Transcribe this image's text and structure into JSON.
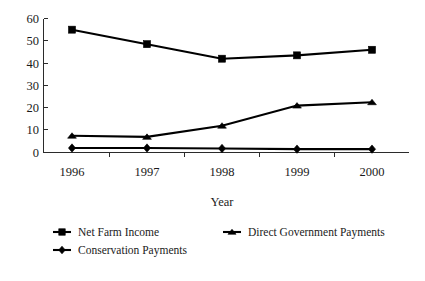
{
  "chart_data": {
    "type": "line",
    "title": "",
    "xlabel": "Year",
    "ylabel": "",
    "categories": [
      "1996",
      "1997",
      "1998",
      "1999",
      "2000"
    ],
    "ylim": [
      0,
      60
    ],
    "yticks": [
      "0",
      "10",
      "20",
      "30",
      "40",
      "50",
      "60"
    ],
    "grid": false,
    "legend_position": "bottom",
    "series": [
      {
        "name": "Net Farm Income",
        "marker": "square",
        "color": "#000000",
        "values": [
          55,
          48.5,
          42,
          43.5,
          46
        ]
      },
      {
        "name": "Direct Government Payments",
        "marker": "triangle",
        "color": "#000000",
        "values": [
          7.5,
          7,
          12,
          21,
          22.5
        ]
      },
      {
        "name": "Conservation Payments",
        "marker": "diamond",
        "color": "#000000",
        "values": [
          2,
          2,
          1.8,
          1.5,
          1.5
        ]
      }
    ]
  },
  "axis": {
    "x_title": "Year",
    "y_ticks": [
      "60",
      "50",
      "40",
      "30",
      "20",
      "10",
      "0"
    ],
    "x_ticks": [
      "1996",
      "1997",
      "1998",
      "1999",
      "2000"
    ]
  },
  "legend": {
    "entries": [
      {
        "label": "Net Farm Income",
        "marker": "square"
      },
      {
        "label": "Direct Government Payments",
        "marker": "triangle"
      },
      {
        "label": "Conservation Payments",
        "marker": "diamond"
      }
    ]
  }
}
